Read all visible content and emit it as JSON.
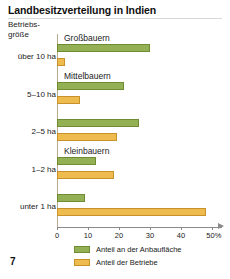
{
  "title": "Landbesitzverteilung in Indien",
  "page_number": "7",
  "axis": {
    "y_axis_label_line1": "Betriebs-",
    "y_axis_label_line2": "größe",
    "x_tick_labels": [
      "0",
      "10",
      "20",
      "30",
      "40",
      "50%"
    ],
    "x_ticks": [
      0,
      10,
      20,
      30,
      40,
      50
    ]
  },
  "legend": {
    "items": [
      {
        "color": "#93b055",
        "label": "Anteil an der Anbaufläche"
      },
      {
        "color": "#eebb4e",
        "label": "Anteil der Betriebe"
      }
    ]
  },
  "group_notes": [
    {
      "label": "Großbauern"
    },
    {
      "label": "Mittelbauern"
    },
    {
      "label": "Kleinbauern"
    }
  ],
  "chart_data": {
    "type": "bar",
    "title": "Landbesitzverteilung in Indien",
    "xlabel": "%",
    "ylabel": "Betriebsgröße",
    "orientation": "horizontal",
    "xlim": [
      0,
      50
    ],
    "grid": false,
    "legend_position": "bottom-left",
    "categories": [
      "über 10 ha",
      "5–10 ha",
      "2–5 ha",
      "1–2 ha",
      "unter 1 ha"
    ],
    "annotations": [
      "Großbauern",
      "Mittelbauern",
      "Kleinbauern"
    ],
    "series": [
      {
        "name": "Anteil an der Anbaufläche",
        "color": "#93b055",
        "values": [
          30,
          21.5,
          26.5,
          12.5,
          9
        ]
      },
      {
        "name": "Anteil der Betriebe",
        "color": "#eebb4e",
        "values": [
          2.5,
          7.5,
          19.5,
          18.5,
          48
        ]
      }
    ]
  }
}
